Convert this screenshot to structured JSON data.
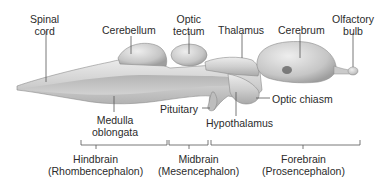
{
  "figure": {
    "type": "brain-anatomy-lateral-view",
    "labels": {
      "spinal_cord": [
        "Spinal",
        "cord"
      ],
      "cerebellum": "Cerebellum",
      "optic_tectum": [
        "Optic",
        "tectum"
      ],
      "thalamus": "Thalamus",
      "cerebrum": "Cerebrum",
      "olfactory_bulb": [
        "Olfactory",
        "bulb"
      ],
      "medulla_oblongata": [
        "Medulla",
        "oblongata"
      ],
      "pituitary": "Pituitary",
      "hypothalamus": "Hypothalamus",
      "optic_chiasm": "Optic chiasm"
    },
    "divisions": [
      {
        "name": "Hindbrain",
        "latin": "(Rhombencephalon)"
      },
      {
        "name": "Midbrain",
        "latin": "(Mesencephalon)"
      },
      {
        "name": "Forebrain",
        "latin": "(Prosencephalon)"
      }
    ],
    "colors": {
      "tissue_light": "#e6e6e6",
      "tissue_mid": "#c4c4c4",
      "tissue_dark": "#9a9a9a",
      "leader_line": "#555555",
      "text": "#2b2b2b"
    }
  }
}
